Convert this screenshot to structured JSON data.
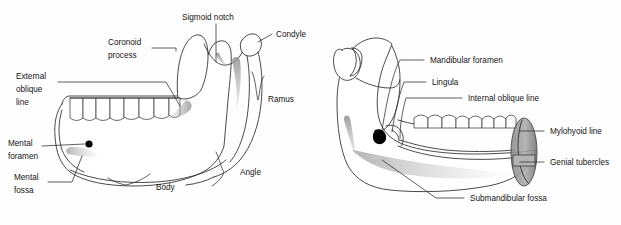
{
  "figure": {
    "background_color": "#fefefe",
    "ink_color": "#2b2b2b",
    "shade_color": "#9a9a9a"
  },
  "left_view": {
    "name": "Lateral (external) view of the mandible",
    "labels": {
      "sigmoid_notch": "Sigmoid notch",
      "coronoid_process_line1": "Coronoid",
      "coronoid_process_line2": "process",
      "condyle": "Condyle",
      "external_oblique_line1": "External",
      "external_oblique_line2": "oblique",
      "external_oblique_line3": "line",
      "ramus": "Ramus",
      "mental_foramen_line1": "Mental",
      "mental_foramen_line2": "foramen",
      "mental_fossa_line1": "Mental",
      "mental_fossa_line2": "fossa",
      "body": "Body",
      "angle": "Angle"
    }
  },
  "right_view": {
    "name": "Medial (internal) view of the mandible",
    "labels": {
      "mandibular_foramen": "Mandibular foramen",
      "lingula": "Lingula",
      "internal_oblique_line": "Internal oblique line",
      "mylohyoid_line": "Mylohyoid line",
      "genial_tubercles": "Genial tubercles",
      "submandibular_fossa": "Submandibular fossa"
    }
  }
}
